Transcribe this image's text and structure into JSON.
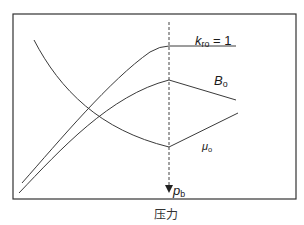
{
  "diagram": {
    "type": "schematic-curves",
    "x_axis_caption": "压力",
    "bubble_point_marker": {
      "symbol": "p",
      "subscript": "b",
      "style": "dashed vertical line with downward arrow"
    },
    "curves": [
      {
        "id": "kro",
        "symbol": "k",
        "subscript": "ro",
        "suffix": " = 1",
        "shape": "rises with pressure, flattens at bubble point and stays constant"
      },
      {
        "id": "bo",
        "symbol": "B",
        "subscript": "o",
        "suffix": "",
        "shape": "rises to peak at bubble point, then decreases linearly"
      },
      {
        "id": "muo",
        "symbol": "μ",
        "subscript": "o",
        "suffix": "",
        "shape": "decreases to minimum at bubble point, then increases linearly"
      }
    ],
    "colors": {
      "line": "#3a3a3a",
      "frame": "#333333",
      "background": "#ffffff"
    }
  }
}
